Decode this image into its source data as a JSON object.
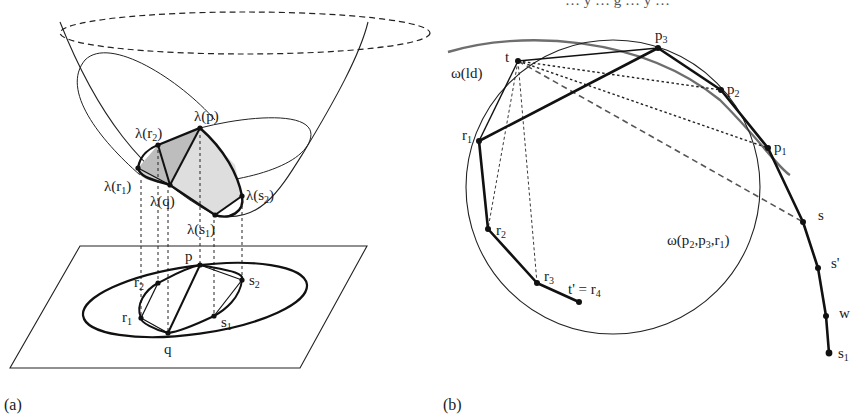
{
  "figure": {
    "top_cut_text": "… y … g … y …",
    "panel_a": {
      "caption": "(a)",
      "labels": {
        "lambda_p": "λ(p)",
        "lambda_r2_main": "λ(r",
        "lambda_r2_sub": "2",
        "lambda_r1_main": "λ(r",
        "lambda_r1_sub": "1",
        "lambda_q": "λ(q)",
        "lambda_s2_main": "λ(s",
        "lambda_s2_sub": "2",
        "lambda_s1_main": "λ(s",
        "lambda_s1_sub": "1",
        "close_paren": ")",
        "p": "p",
        "q": "q",
        "r1_main": "r",
        "r1_sub": "1",
        "r2_main": "r",
        "r2_sub": "2",
        "s1_main": "s",
        "s1_sub": "1",
        "s2_main": "s",
        "s2_sub": "2"
      },
      "colors": {
        "stroke": "#111111",
        "shade_dark": "#bdbdbd",
        "shade_light": "#dedede"
      }
    },
    "panel_b": {
      "caption": "(b)",
      "labels": {
        "omega_ld": "ω(ld)",
        "omega_circle_main": "ω(p",
        "omega_circle_rest": "2",
        "omega_circle_p": ",p",
        "omega_circle_p_sub": "3",
        "omega_circle_r": ",r",
        "omega_circle_r_sub": "1",
        "omega_circle_close": ")",
        "t": "t",
        "p3_main": "p",
        "p3_sub": "3",
        "p2_main": "p",
        "p2_sub": "2",
        "p1_main": "p",
        "p1_sub": "1",
        "r1_main": "r",
        "r1_sub": "1",
        "r2_main": "r",
        "r2_sub": "2",
        "r3_main": "r",
        "r3_sub": "3",
        "t_prime": "t' = r",
        "t_prime_sub": "4",
        "s": "s",
        "s_prime": "s'",
        "w": "w",
        "s1_main": "s",
        "s1_sub": "1"
      },
      "colors": {
        "stroke": "#111111",
        "gray_arc": "#6e6e6e",
        "dashed": "#555555"
      }
    }
  }
}
